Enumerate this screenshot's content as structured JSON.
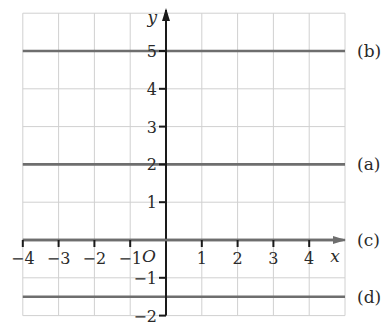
{
  "chart_data": {
    "type": "line",
    "title": "",
    "xlabel": "x",
    "ylabel": "y",
    "origin_label": "O",
    "xlim": [
      -4,
      5
    ],
    "ylim": [
      -2,
      6
    ],
    "grid": true,
    "x_ticks": [
      -4,
      -3,
      -2,
      -1,
      1,
      2,
      3,
      4
    ],
    "x_tick_labels": [
      "−4",
      "−3",
      "−2",
      "−1",
      "1",
      "2",
      "3",
      "4"
    ],
    "y_ticks": [
      -2,
      -1,
      1,
      2,
      3,
      4,
      5
    ],
    "y_tick_labels": [
      "−2",
      "−1",
      "1",
      "2",
      "3",
      "4",
      "5"
    ],
    "series": [
      {
        "name": "(b)",
        "equation": "y = 5",
        "y": 5
      },
      {
        "name": "(a)",
        "equation": "y = 2",
        "y": 2
      },
      {
        "name": "(c)",
        "equation": "y = 0",
        "y": 0
      },
      {
        "name": "(d)",
        "equation": "y = -1.5",
        "y": -1.5
      }
    ],
    "colors": {
      "grid": "#d0d0d0",
      "axes": "#1a1a1a",
      "lines": "#6e6e6e",
      "text": "#2a2a2a"
    }
  }
}
